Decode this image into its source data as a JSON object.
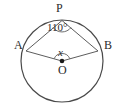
{
  "figure": {
    "type": "circle-geometry-diagram",
    "background_color": "#ffffff",
    "stroke_color": "#4a4a4a",
    "text_color": "#2b2b2b",
    "circle": {
      "center_x": 62,
      "center_y": 61,
      "radius": 41
    },
    "points": [
      {
        "name": "P",
        "label": "P",
        "x": 62,
        "y": 20
      },
      {
        "name": "A",
        "label": "A",
        "x": 25,
        "y": 50
      },
      {
        "name": "B",
        "label": "B",
        "x": 99,
        "y": 50
      },
      {
        "name": "O",
        "label": "O",
        "x": 62,
        "y": 61
      }
    ],
    "segments": [
      {
        "name": "chord-PA",
        "from": "P",
        "to": "A"
      },
      {
        "name": "chord-PB",
        "from": "P",
        "to": "B"
      },
      {
        "name": "radius-OA",
        "from": "O",
        "to": "A"
      },
      {
        "name": "radius-OB",
        "from": "O",
        "to": "B"
      }
    ],
    "labels": {
      "point_p": "P",
      "point_a": "A",
      "point_b": "B",
      "point_o": "O",
      "inscribed_angle": "110°",
      "central_angle_variable": "x"
    },
    "angles": [
      {
        "name": "angle-APB",
        "vertex": "P",
        "value": "110°",
        "numeric": 110,
        "kind": "inscribed"
      },
      {
        "name": "angle-AOB",
        "vertex": "O",
        "value": "x",
        "numeric": null,
        "kind": "central"
      }
    ]
  }
}
